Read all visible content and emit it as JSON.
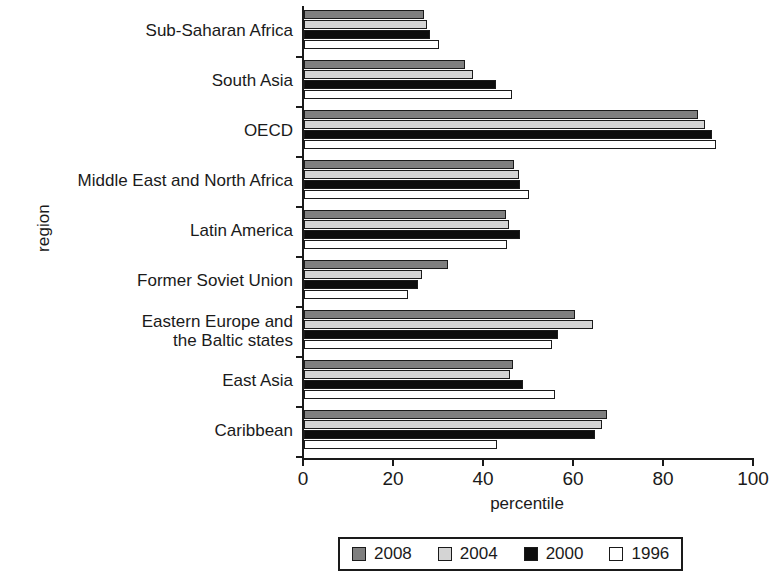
{
  "chart_data": {
    "type": "bar",
    "orientation": "horizontal",
    "title": "",
    "xlabel": "percentile",
    "ylabel": "region",
    "xlim": [
      0,
      100
    ],
    "xticks": [
      0,
      20,
      40,
      60,
      80,
      100
    ],
    "xticklabels": [
      "0",
      "20",
      "40",
      "60",
      "80",
      "100"
    ],
    "grid": false,
    "legend_position": "below-axes",
    "categories": [
      "Sub-Saharan Africa",
      "South Asia",
      "OECD",
      "Middle East and North Africa",
      "Latin America",
      "Former Soviet Union",
      "Eastern Europe and\nthe Baltic states",
      "East Asia",
      "Caribbean"
    ],
    "series": [
      {
        "name": "2008",
        "color": "#7f7f7f",
        "values": [
          26.7,
          35.8,
          87.6,
          46.7,
          44.9,
          32.0,
          60.2,
          46.4,
          67.3
        ]
      },
      {
        "name": "2004",
        "color": "#d4d4d4",
        "values": [
          27.3,
          37.6,
          89.1,
          47.8,
          45.6,
          26.2,
          64.2,
          45.8,
          66.2
        ]
      },
      {
        "name": "2000",
        "color": "#0d0d0d",
        "values": [
          28.0,
          42.7,
          90.7,
          48.0,
          48.0,
          25.3,
          56.4,
          48.7,
          64.7
        ]
      },
      {
        "name": "1996",
        "color": "#ffffff",
        "values": [
          30.0,
          46.2,
          91.6,
          50.0,
          45.1,
          23.1,
          55.1,
          55.8,
          42.9
        ]
      }
    ]
  },
  "axis": {
    "ylabel": "region",
    "xlabel": "percentile"
  },
  "legend": {
    "entries": [
      {
        "label": "2008",
        "color": "#7f7f7f"
      },
      {
        "label": "2004",
        "color": "#d4d4d4"
      },
      {
        "label": "2000",
        "color": "#0d0d0d"
      },
      {
        "label": "1996",
        "color": "#ffffff"
      }
    ]
  }
}
